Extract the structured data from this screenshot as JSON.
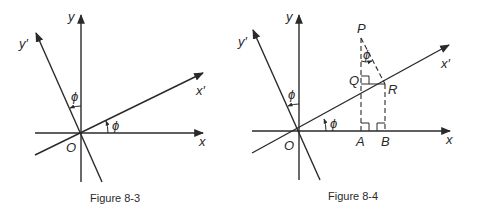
{
  "figures": [
    {
      "caption": "Figure 8-3",
      "labels": {
        "y": "y",
        "y_prime": "y′",
        "x": "x",
        "x_prime": "x′",
        "origin": "O",
        "phi_top": "ϕ",
        "phi_bottom": "ϕ"
      }
    },
    {
      "caption": "Figure 8-4",
      "labels": {
        "y": "y",
        "y_prime": "y′",
        "x": "x",
        "x_prime": "x′",
        "origin": "O",
        "phi_left": "ϕ",
        "phi_bottom": "ϕ",
        "phi_p": "ϕ",
        "P": "P",
        "Q": "Q",
        "R": "R",
        "A": "A",
        "B": "B"
      }
    }
  ],
  "colors": {
    "ink": "#2a2a2a",
    "background": "#ffffff"
  }
}
